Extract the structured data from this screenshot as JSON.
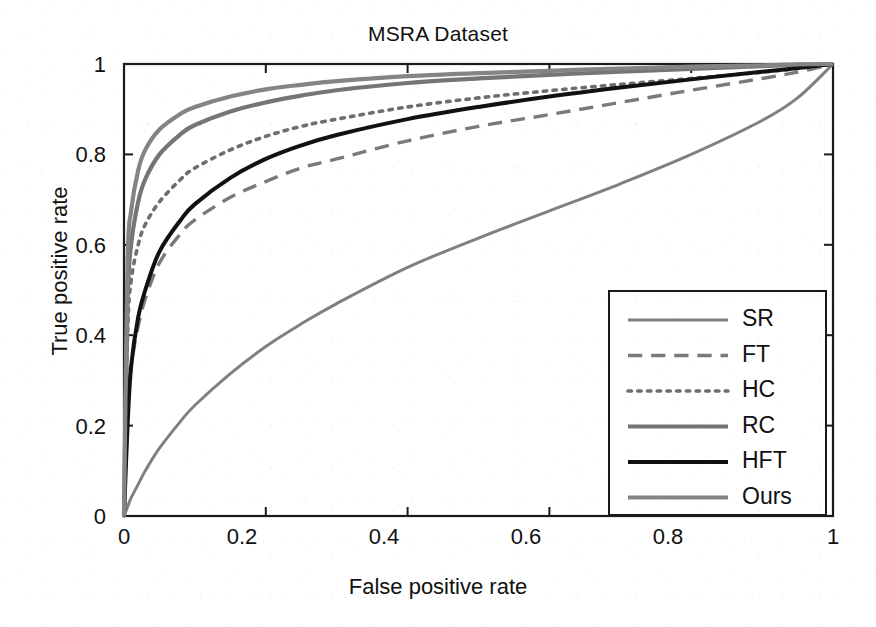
{
  "chart_data": {
    "type": "line",
    "title": "MSRA Dataset",
    "xlabel": "False positive rate",
    "ylabel": "True positive rate",
    "xlim": [
      0,
      1
    ],
    "ylim": [
      0,
      1
    ],
    "grid": false,
    "legend_position": "bottom-right",
    "xticks": [
      "0",
      "0.2",
      "0.4",
      "0.6",
      "0.8",
      "1"
    ],
    "yticks": [
      "0",
      "0.2",
      "0.4",
      "0.6",
      "0.8",
      "1"
    ],
    "xtick_values": [
      0,
      0.2,
      0.4,
      0.6,
      0.8,
      1
    ],
    "ytick_values": [
      0,
      0.2,
      0.4,
      0.6,
      0.8,
      1
    ],
    "x": [
      0,
      0.005,
      0.01,
      0.02,
      0.03,
      0.05,
      0.08,
      0.1,
      0.15,
      0.2,
      0.25,
      0.3,
      0.4,
      0.5,
      0.6,
      0.7,
      0.8,
      0.9,
      0.95,
      1
    ],
    "series": [
      {
        "name": "SR",
        "style": "solid",
        "color": "#808080",
        "width": 3,
        "values": [
          0,
          0.02,
          0.04,
          0.07,
          0.1,
          0.15,
          0.21,
          0.245,
          0.315,
          0.375,
          0.425,
          0.47,
          0.55,
          0.615,
          0.675,
          0.735,
          0.8,
          0.875,
          0.925,
          1.0
        ]
      },
      {
        "name": "FT",
        "style": "dashed",
        "color": "#7a7a7a",
        "width": 3.4,
        "values": [
          0,
          0.22,
          0.33,
          0.42,
          0.48,
          0.56,
          0.625,
          0.655,
          0.705,
          0.74,
          0.77,
          0.79,
          0.83,
          0.862,
          0.888,
          0.915,
          0.942,
          0.968,
          0.982,
          1.0
        ]
      },
      {
        "name": "HC",
        "style": "dotted",
        "color": "#6e6e6e",
        "width": 3.6,
        "values": [
          0,
          0.4,
          0.52,
          0.6,
          0.645,
          0.695,
          0.745,
          0.77,
          0.81,
          0.84,
          0.862,
          0.878,
          0.905,
          0.925,
          0.941,
          0.955,
          0.968,
          0.982,
          0.99,
          1.0
        ]
      },
      {
        "name": "RC",
        "style": "solid",
        "color": "#757575",
        "width": 4.2,
        "values": [
          0,
          0.47,
          0.6,
          0.695,
          0.745,
          0.8,
          0.845,
          0.865,
          0.895,
          0.915,
          0.93,
          0.942,
          0.958,
          0.968,
          0.976,
          0.983,
          0.989,
          0.995,
          0.998,
          1.0
        ]
      },
      {
        "name": "HFT",
        "style": "solid",
        "color": "#111111",
        "width": 4.0,
        "values": [
          0,
          0.2,
          0.33,
          0.44,
          0.5,
          0.585,
          0.655,
          0.69,
          0.748,
          0.79,
          0.82,
          0.843,
          0.878,
          0.905,
          0.928,
          0.948,
          0.966,
          0.983,
          0.991,
          1.0
        ]
      },
      {
        "name": "Ours",
        "style": "solid",
        "color": "#848484",
        "width": 4.2,
        "values": [
          0,
          0.56,
          0.675,
          0.765,
          0.81,
          0.855,
          0.89,
          0.905,
          0.928,
          0.944,
          0.954,
          0.962,
          0.973,
          0.98,
          0.985,
          0.99,
          0.994,
          0.997,
          0.999,
          1.0
        ]
      }
    ]
  },
  "legend": {
    "entries": [
      {
        "label": "SR"
      },
      {
        "label": "FT"
      },
      {
        "label": "HC"
      },
      {
        "label": "RC"
      },
      {
        "label": "HFT"
      },
      {
        "label": "Ours"
      }
    ]
  }
}
